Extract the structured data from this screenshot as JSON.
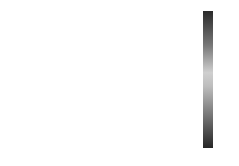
{
  "chart_data": {
    "type": "heatmap",
    "title": "",
    "panels": [
      {
        "label": "(a)",
        "rows": 28,
        "cols": 5,
        "values": [
          [
            0.7,
            0.7,
            0.1,
            0.1,
            0.0
          ],
          [
            0.6,
            0.6,
            0.1,
            0.0,
            0.0
          ],
          [
            0.1,
            0.0,
            0.1,
            0.1,
            0.0
          ],
          [
            0.0,
            0.2,
            0.1,
            0.1,
            0.0
          ],
          [
            0.6,
            0.1,
            0.0,
            0.1,
            0.1
          ],
          [
            0.6,
            0.1,
            0.1,
            0.1,
            0.1
          ],
          [
            0.6,
            0.1,
            0.0,
            0.0,
            0.0
          ],
          [
            0.7,
            0.6,
            0.1,
            0.1,
            0.0
          ],
          [
            0.1,
            0.1,
            0.0,
            0.1,
            0.1
          ],
          [
            0.1,
            0.0,
            0.1,
            0.1,
            0.1
          ],
          [
            0.7,
            0.7,
            0.6,
            0.1,
            0.1
          ],
          [
            0.7,
            0.6,
            0.6,
            0.1,
            0.0
          ],
          [
            0.1,
            0.1,
            0.6,
            0.1,
            0.1
          ],
          [
            0.7,
            0.7,
            0.1,
            0.1,
            0.1
          ],
          [
            0.2,
            0.1,
            0.1,
            0.0,
            0.0
          ],
          [
            0.0,
            0.1,
            0.0,
            0.1,
            0.1
          ],
          [
            0.6,
            0.1,
            0.1,
            0.1,
            0.0
          ],
          [
            0.1,
            0.6,
            0.1,
            0.1,
            0.1
          ],
          [
            0.1,
            0.1,
            0.1,
            0.0,
            0.1
          ],
          [
            0.7,
            0.7,
            0.7,
            0.1,
            0.1
          ],
          [
            0.7,
            0.7,
            0.7,
            0.1,
            0.0
          ],
          [
            0.1,
            0.1,
            0.1,
            0.1,
            0.1
          ],
          [
            0.6,
            0.6,
            0.1,
            0.1,
            0.1
          ],
          [
            0.7,
            0.1,
            0.7,
            0.1,
            0.1
          ],
          [
            0.6,
            0.1,
            0.1,
            0.1,
            0.0
          ],
          [
            0.1,
            0.1,
            0.1,
            0.1,
            0.1
          ],
          [
            0.1,
            0.6,
            0.1,
            0.1,
            0.1
          ],
          [
            0.1,
            0.1,
            0.1,
            0.1,
            0.1
          ]
        ]
      },
      {
        "label": "(b)",
        "rows": 28,
        "cols": 5,
        "values": [
          [
            0.1,
            0.1,
            0.1,
            0.1,
            0.1
          ],
          [
            0.1,
            0.1,
            0.6,
            0.1,
            0.1
          ],
          [
            0.1,
            0.1,
            0.1,
            0.1,
            0.1
          ],
          [
            0.1,
            0.6,
            0.1,
            0.1,
            0.1
          ],
          [
            0.1,
            0.7,
            0.1,
            0.1,
            0.1
          ],
          [
            0.1,
            0.1,
            0.1,
            0.1,
            0.1
          ],
          [
            0.1,
            0.6,
            0.6,
            0.1,
            0.1
          ],
          [
            0.1,
            0.1,
            0.1,
            0.1,
            0.1
          ],
          [
            0.1,
            0.1,
            0.1,
            0.1,
            0.1
          ],
          [
            0.1,
            0.1,
            0.1,
            0.6,
            0.1
          ],
          [
            0.1,
            0.1,
            0.6,
            0.1,
            0.1
          ],
          [
            0.1,
            0.6,
            0.1,
            0.1,
            0.1
          ],
          [
            0.1,
            0.1,
            0.1,
            0.6,
            0.1
          ],
          [
            0.1,
            0.1,
            0.1,
            0.1,
            0.1
          ],
          [
            0.1,
            0.1,
            0.7,
            0.1,
            0.1
          ],
          [
            0.1,
            0.1,
            0.1,
            0.1,
            0.1
          ],
          [
            0.1,
            0.6,
            0.1,
            0.1,
            0.1
          ],
          [
            0.1,
            0.7,
            0.6,
            0.1,
            0.1
          ],
          [
            0.1,
            0.1,
            0.7,
            0.7,
            0.1
          ],
          [
            0.6,
            0.1,
            0.1,
            0.1,
            0.1
          ],
          [
            0.1,
            0.1,
            0.1,
            0.1,
            0.1
          ],
          [
            0.1,
            0.6,
            0.7,
            0.1,
            0.1
          ],
          [
            0.1,
            0.1,
            0.1,
            0.1,
            0.1
          ],
          [
            0.1,
            0.1,
            0.1,
            0.1,
            0.1
          ],
          [
            0.1,
            0.1,
            0.1,
            0.1,
            0.1
          ],
          [
            0.1,
            0.1,
            0.1,
            0.1,
            0.1
          ],
          [
            0.1,
            0.1,
            0.1,
            0.1,
            0.1
          ],
          [
            0.1,
            0.1,
            0.1,
            0.1,
            0.1
          ]
        ]
      },
      {
        "label": "(c)",
        "rows": 28,
        "cols": 5,
        "values": [
          [
            0.1,
            0.1,
            0.1,
            0.1,
            0.1
          ],
          [
            0.1,
            0.1,
            0.1,
            0.1,
            0.1
          ],
          [
            0.1,
            0.1,
            0.1,
            0.1,
            0.1
          ],
          [
            0.1,
            0.6,
            0.6,
            0.1,
            0.1
          ],
          [
            0.1,
            0.1,
            0.6,
            0.1,
            0.1
          ],
          [
            0.1,
            0.1,
            0.1,
            0.1,
            0.1
          ],
          [
            0.1,
            0.1,
            0.6,
            0.1,
            0.1
          ],
          [
            0.1,
            0.1,
            0.1,
            0.1,
            0.1
          ],
          [
            0.1,
            0.1,
            0.1,
            0.1,
            0.1
          ],
          [
            0.1,
            0.1,
            0.1,
            0.1,
            0.1
          ],
          [
            0.1,
            0.1,
            0.1,
            0.6,
            0.1
          ],
          [
            0.1,
            0.1,
            0.1,
            0.1,
            0.1
          ],
          [
            0.1,
            0.1,
            0.1,
            0.6,
            0.1
          ],
          [
            0.1,
            0.1,
            0.1,
            0.1,
            0.1
          ],
          [
            0.1,
            0.1,
            0.1,
            0.1,
            0.1
          ],
          [
            0.1,
            0.1,
            0.1,
            0.1,
            0.1
          ],
          [
            0.1,
            0.1,
            0.1,
            0.1,
            0.1
          ],
          [
            0.1,
            0.1,
            0.1,
            0.1,
            0.1
          ],
          [
            0.1,
            0.1,
            0.1,
            0.1,
            0.1
          ],
          [
            0.1,
            0.1,
            0.1,
            0.1,
            0.1
          ],
          [
            0.1,
            0.1,
            0.1,
            0.1,
            0.1
          ],
          [
            0.1,
            0.1,
            0.1,
            0.1,
            0.1
          ],
          [
            0.1,
            0.1,
            0.1,
            0.6,
            0.6
          ],
          [
            0.1,
            0.1,
            0.1,
            0.1,
            0.1
          ],
          [
            0.1,
            0.1,
            0.1,
            0.6,
            0.6
          ],
          [
            0.1,
            0.1,
            0.1,
            0.1,
            0.1
          ],
          [
            0.1,
            0.1,
            0.1,
            0.1,
            0.1
          ],
          [
            0.1,
            0.1,
            0.1,
            0.1,
            0.1
          ]
        ]
      },
      {
        "label": "(d)",
        "rows": 28,
        "cols": 5,
        "values": [
          [
            0.1,
            0.1,
            0.1,
            0.1,
            0.1
          ],
          [
            0.6,
            0.1,
            0.1,
            0.1,
            0.1
          ],
          [
            0.1,
            0.1,
            0.1,
            0.1,
            0.1
          ],
          [
            0.1,
            0.1,
            0.1,
            0.1,
            0.1
          ],
          [
            0.6,
            0.1,
            0.1,
            0.1,
            0.1
          ],
          [
            0.6,
            0.1,
            0.1,
            0.1,
            0.1
          ],
          [
            0.6,
            0.1,
            0.1,
            0.1,
            0.1
          ],
          [
            0.1,
            0.1,
            0.1,
            0.1,
            0.1
          ],
          [
            0.1,
            0.1,
            0.1,
            0.1,
            0.1
          ],
          [
            0.1,
            0.1,
            0.1,
            0.1,
            0.1
          ],
          [
            0.6,
            0.6,
            0.1,
            0.1,
            0.1
          ],
          [
            0.1,
            0.1,
            0.1,
            0.1,
            0.1
          ],
          [
            0.1,
            0.1,
            0.1,
            0.1,
            0.1
          ],
          [
            0.1,
            0.1,
            0.1,
            0.1,
            0.1
          ],
          [
            0.7,
            0.6,
            0.1,
            0.1,
            0.1
          ],
          [
            0.1,
            0.1,
            0.1,
            0.1,
            0.1
          ],
          [
            0.6,
            0.1,
            0.1,
            0.1,
            0.1
          ],
          [
            0.7,
            0.7,
            0.7,
            0.1,
            0.1
          ],
          [
            0.1,
            0.1,
            0.1,
            0.1,
            0.1
          ],
          [
            0.6,
            0.7,
            0.1,
            0.1,
            0.1
          ],
          [
            0.1,
            0.1,
            0.1,
            0.1,
            0.1
          ],
          [
            0.6,
            0.1,
            0.1,
            0.1,
            0.1
          ],
          [
            0.7,
            0.6,
            0.1,
            0.1,
            0.1
          ],
          [
            0.1,
            0.1,
            0.1,
            0.1,
            0.1
          ],
          [
            0.6,
            0.1,
            0.1,
            0.1,
            0.1
          ],
          [
            0.6,
            0.6,
            0.1,
            0.1,
            0.1
          ],
          [
            0.1,
            0.1,
            0.1,
            0.1,
            0.1
          ],
          [
            0.1,
            0.1,
            0.1,
            0.1,
            0.1
          ]
        ]
      },
      {
        "label": "(e)",
        "rows": 28,
        "cols": 5,
        "values": [
          [
            0.1,
            0.1,
            0.1,
            0.1,
            0.1
          ],
          [
            0.1,
            0.1,
            0.6,
            0.1,
            0.1
          ],
          [
            0.1,
            0.1,
            0.1,
            0.1,
            0.1
          ],
          [
            0.1,
            0.7,
            0.1,
            0.1,
            0.1
          ],
          [
            0.1,
            0.6,
            0.1,
            0.1,
            0.1
          ],
          [
            0.1,
            0.1,
            0.1,
            0.1,
            0.1
          ],
          [
            0.1,
            0.1,
            0.6,
            0.1,
            0.1
          ],
          [
            0.1,
            0.1,
            0.1,
            0.1,
            0.1
          ],
          [
            0.1,
            0.1,
            0.1,
            0.1,
            0.1
          ],
          [
            0.1,
            0.1,
            0.1,
            0.1,
            0.1
          ],
          [
            0.1,
            0.1,
            0.1,
            0.1,
            0.1
          ],
          [
            0.1,
            0.1,
            0.1,
            0.1,
            0.1
          ],
          [
            0.1,
            0.1,
            0.1,
            0.1,
            0.1
          ],
          [
            0.1,
            0.1,
            0.1,
            0.1,
            0.1
          ],
          [
            0.1,
            0.1,
            0.1,
            0.6,
            0.1
          ],
          [
            0.1,
            0.1,
            0.1,
            0.1,
            0.1
          ],
          [
            0.1,
            0.6,
            0.6,
            0.1,
            0.1
          ],
          [
            0.1,
            0.1,
            0.1,
            0.1,
            0.1
          ],
          [
            0.1,
            0.7,
            0.6,
            0.1,
            0.1
          ],
          [
            0.1,
            0.1,
            0.1,
            0.1,
            0.1
          ],
          [
            0.1,
            0.1,
            0.1,
            0.1,
            0.1
          ],
          [
            0.1,
            0.1,
            0.1,
            0.1,
            0.1
          ],
          [
            0.1,
            0.1,
            0.1,
            0.1,
            0.1
          ],
          [
            0.1,
            0.1,
            0.1,
            0.6,
            0.1
          ],
          [
            0.1,
            0.1,
            0.1,
            0.1,
            0.1
          ],
          [
            0.1,
            0.1,
            0.1,
            0.1,
            0.1
          ],
          [
            0.6,
            0.1,
            0.1,
            0.1,
            0.1
          ],
          [
            0.1,
            0.1,
            0.1,
            0.1,
            0.1
          ]
        ]
      },
      {
        "label": "(f)",
        "rows": 28,
        "cols": 5,
        "values": [
          [
            0.1,
            0.1,
            0.1,
            0.1,
            0.1
          ],
          [
            0.1,
            0.1,
            0.1,
            0.6,
            0.1
          ],
          [
            0.1,
            0.1,
            0.1,
            0.1,
            0.1
          ],
          [
            0.1,
            0.1,
            0.1,
            0.1,
            0.1
          ],
          [
            0.1,
            0.6,
            0.1,
            0.1,
            0.1
          ],
          [
            0.1,
            0.1,
            0.1,
            0.1,
            0.1
          ],
          [
            0.1,
            0.6,
            0.1,
            0.1,
            0.1
          ],
          [
            0.1,
            0.1,
            0.1,
            0.1,
            0.1
          ],
          [
            0.1,
            0.1,
            0.1,
            0.1,
            0.1
          ],
          [
            0.1,
            0.1,
            0.1,
            0.1,
            0.1
          ],
          [
            0.1,
            0.1,
            0.1,
            0.1,
            0.1
          ],
          [
            0.1,
            0.1,
            0.1,
            0.7,
            0.1
          ],
          [
            0.1,
            0.1,
            0.1,
            0.7,
            0.1
          ],
          [
            0.1,
            0.1,
            0.1,
            0.6,
            0.1
          ],
          [
            0.1,
            0.1,
            0.1,
            0.1,
            0.1
          ],
          [
            0.1,
            0.1,
            0.6,
            0.1,
            0.1
          ],
          [
            0.1,
            0.1,
            0.1,
            0.1,
            0.1
          ],
          [
            0.1,
            0.1,
            0.1,
            0.1,
            0.1
          ],
          [
            0.1,
            0.1,
            0.1,
            0.1,
            0.1
          ],
          [
            0.1,
            0.1,
            0.1,
            0.6,
            0.1
          ],
          [
            0.1,
            0.1,
            0.1,
            0.1,
            0.1
          ],
          [
            0.1,
            0.1,
            0.1,
            0.1,
            0.1
          ],
          [
            0.1,
            0.1,
            0.1,
            0.1,
            0.1
          ],
          [
            0.1,
            0.6,
            0.6,
            0.1,
            0.1
          ],
          [
            0.1,
            0.1,
            0.1,
            0.1,
            0.1
          ],
          [
            0.1,
            0.1,
            0.1,
            0.1,
            0.1
          ],
          [
            0.1,
            0.1,
            0.1,
            0.1,
            0.1
          ],
          [
            0.1,
            0.1,
            0.1,
            0.1,
            0.1
          ]
        ]
      }
    ],
    "colorbar": {
      "ticks": [
        "0.8",
        "0.6",
        "0.4",
        "0.2",
        "0",
        "-0.2",
        "-0.4",
        "-0.6",
        "-0.8"
      ],
      "range": [
        -0.9,
        0.9
      ],
      "colormap": "gray (dark at extremes, light near zero)"
    },
    "xlabel": "",
    "ylabel": ""
  }
}
